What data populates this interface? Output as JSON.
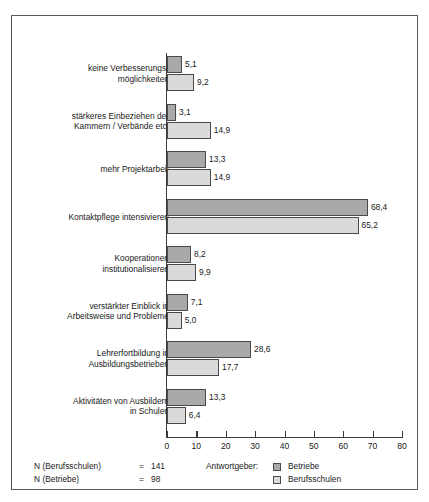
{
  "chart_data": {
    "type": "bar",
    "orientation": "horizontal",
    "title": "",
    "xlabel": "",
    "ylabel": "",
    "xlim": [
      0,
      80
    ],
    "xticks": [
      0,
      10,
      20,
      30,
      40,
      50,
      60,
      70,
      80
    ],
    "grid": false,
    "legend_position": "bottom-right",
    "legend_title": "Antwortgeber:",
    "categories": [
      "keine Verbesserungs-\nmöglichkeiten",
      "stärkeres Einbeziehen der\nKammern / Verbände etc.",
      "mehr Projektarbeit",
      "Kontaktpflege intensivieren",
      "Kooperationen\ninstitutionalisieren",
      "verstärkter Einblick in\nArbeitsweise und Probleme",
      "Lehrerfortbildung in\nAusbildungsbetrieben",
      "Aktivitäten von Ausbildern\nin Schulen"
    ],
    "series": [
      {
        "name": "Betriebe",
        "color": "#a9a9a9",
        "values": [
          5.1,
          3.1,
          13.3,
          68.4,
          8.2,
          7.1,
          28.6,
          13.3
        ],
        "value_labels": [
          "5,1",
          "3,1",
          "13,3",
          "68,4",
          "8,2",
          "7,1",
          "28,6",
          "13,3"
        ]
      },
      {
        "name": "Berufsschulen",
        "color": "#dadada",
        "values": [
          9.2,
          14.9,
          14.9,
          65.2,
          9.9,
          5.0,
          17.7,
          6.4
        ],
        "value_labels": [
          "9,2",
          "14,9",
          "14,9",
          "65,2",
          "9,9",
          "5,0",
          "17,7",
          "6,4"
        ]
      }
    ],
    "notes": [
      {
        "key": "N (Berufsschulen)",
        "eq": "=",
        "value": "141"
      },
      {
        "key": "N (Betriebe)",
        "eq": "=",
        "value": "98"
      }
    ]
  }
}
